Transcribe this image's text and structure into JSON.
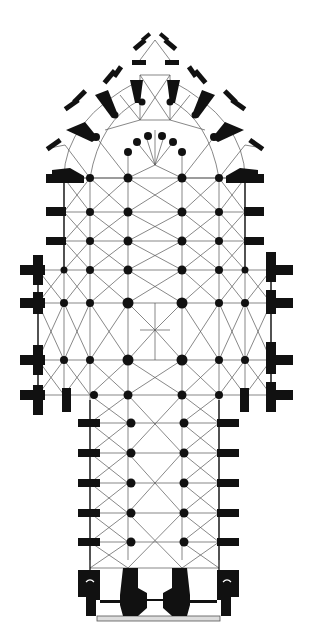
{
  "figure": {
    "type": "architectural-floor-plan",
    "orientation": "apse at top, west facade at bottom",
    "colors": {
      "ink": "#111111",
      "background": "#ffffff",
      "line": "#333333"
    },
    "parts": [
      "chevet-with-radiating-chapels",
      "choir",
      "transept",
      "nave",
      "west-facade-towers"
    ]
  }
}
